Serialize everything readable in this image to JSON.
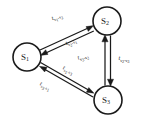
{
  "figure": {
    "type": "state-transition-diagram",
    "background_color": "#ffffff",
    "stroke_color": "#1a1a1a",
    "width": 142,
    "height": 127
  },
  "nodes": [
    {
      "id": "s1",
      "label": "S",
      "subscript": "1",
      "cx": 27,
      "cy": 57,
      "r": 14
    },
    {
      "id": "s2",
      "label": "S",
      "subscript": "2",
      "cx": 107,
      "cy": 21,
      "r": 14
    },
    {
      "id": "s3",
      "label": "S",
      "subscript": "3",
      "cx": 108,
      "cy": 100,
      "r": 14
    }
  ],
  "edges": [
    {
      "id": "s1-s2",
      "from": "s1",
      "to": "s2",
      "symbol": "t",
      "sub_from": "s",
      "sub_from_idx": "1",
      "sub_to": "s",
      "sub_to_idx": "2",
      "label_text": "t",
      "label_sub": "s1-s2",
      "label_x": 57,
      "label_y": 17
    },
    {
      "id": "s2-s1",
      "from": "s2",
      "to": "s1",
      "symbol": "t",
      "sub_from": "s",
      "sub_from_idx": "2",
      "sub_to": "s",
      "sub_to_idx": "1",
      "label_text": "t",
      "label_sub": "s2-s1",
      "label_x": 71,
      "label_y": 42
    },
    {
      "id": "s2-s3",
      "from": "s2",
      "to": "s3",
      "symbol": "t",
      "sub_from": "s",
      "sub_from_idx": "2",
      "sub_to": "s",
      "sub_to_idx": "3",
      "label_text": "t",
      "label_sub": "s2-s3",
      "label_x": 124,
      "label_y": 59
    },
    {
      "id": "s3-s2",
      "from": "s3",
      "to": "s2",
      "symbol": "t",
      "sub_from": "s",
      "sub_from_idx": "3",
      "sub_to": "s",
      "sub_to_idx": "2",
      "label_text": "t",
      "label_sub": "s3-s2",
      "label_x": 83,
      "label_y": 57
    },
    {
      "id": "s1-s3",
      "from": "s1",
      "to": "s3",
      "symbol": "t",
      "sub_from": "s",
      "sub_from_idx": "1",
      "sub_to": "s",
      "sub_to_idx": "3",
      "label_text": "t",
      "label_sub": "s1-s3",
      "label_x": 68,
      "label_y": 70
    },
    {
      "id": "s3-s1",
      "from": "s3",
      "to": "s1",
      "symbol": "t",
      "sub_from": "s",
      "sub_from_idx": "3",
      "sub_to": "s",
      "sub_to_idx": "1",
      "label_text": "t",
      "label_sub": "s3-s1",
      "label_x": 45,
      "label_y": 86
    }
  ]
}
